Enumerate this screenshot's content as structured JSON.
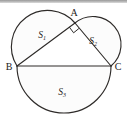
{
  "figure": {
    "background_color": "#ffffff",
    "stroke_color": "#2e2b29",
    "top_rule_color": "#9a9a9a",
    "vertices": [
      {
        "name": "A",
        "label": "A",
        "x": 75,
        "y": 23
      },
      {
        "name": "B",
        "label": "B",
        "x": 17,
        "y": 66
      },
      {
        "name": "C",
        "label": "C",
        "x": 111,
        "y": 66
      }
    ],
    "right_angle": {
      "at_vertex": "A",
      "marker": "square"
    },
    "regions": [
      {
        "name": "S1",
        "base": "AB",
        "letter": "S",
        "subscript": "1",
        "cx": 42,
        "cy": 35
      },
      {
        "name": "S2",
        "base": "AC",
        "letter": "S",
        "subscript": "2",
        "cx": 93,
        "cy": 41
      },
      {
        "name": "S3",
        "base": "BC",
        "letter": "S",
        "subscript": "3",
        "cx": 62,
        "cy": 92
      }
    ],
    "segments": [
      {
        "name": "AB",
        "from": "A",
        "to": "B"
      },
      {
        "name": "AC",
        "from": "A",
        "to": "C"
      },
      {
        "name": "BC",
        "from": "B",
        "to": "C"
      }
    ]
  }
}
